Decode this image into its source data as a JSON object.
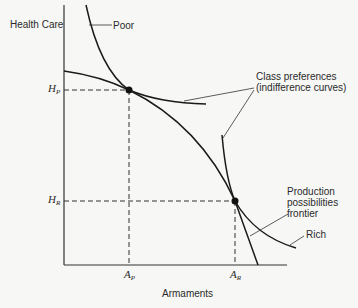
{
  "diagram": {
    "y_axis_label": "Health Care",
    "x_axis_label": "Armaments",
    "labels": {
      "poor": "Poor",
      "rich": "Rich",
      "class_pref_line1": "Class preferences",
      "class_pref_line2": "(indifference curves)",
      "ppf_line1": "Production",
      "ppf_line2": "possibilities",
      "ppf_line3": "frontier"
    },
    "ticks": {
      "hp_main": "H",
      "hp_sub": "P",
      "hr_main": "H",
      "hr_sub": "R",
      "ap_main": "A",
      "ap_sub": "P",
      "ar_main": "A",
      "ar_sub": "R"
    },
    "points": [
      {
        "name": "poor-equilibrium",
        "x": 129,
        "y": 90
      },
      {
        "name": "rich-equilibrium",
        "x": 235,
        "y": 201
      }
    ],
    "colors": {
      "line": "#1a1a1a",
      "background": "#f7f7f5"
    }
  }
}
